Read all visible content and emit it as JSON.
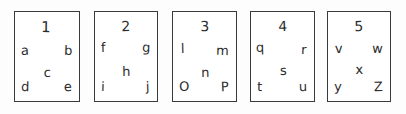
{
  "scene": {
    "description": "hand-drawn sketch of five numbered rectangular cards containing letters",
    "background_color": "#fdfdfd",
    "ink_color": "#2b2b2b",
    "border_color": "#3a3a3a"
  },
  "cards": [
    {
      "number": "1",
      "left": "a",
      "right": "b",
      "center": "c",
      "bottom_left": "d",
      "bottom_right": "e"
    },
    {
      "number": "2",
      "left": "f",
      "right": "g",
      "center": "h",
      "bottom_left": "i",
      "bottom_right": "j"
    },
    {
      "number": "3",
      "left": "l",
      "right": "m",
      "center": "n",
      "bottom_left": "O",
      "bottom_right": "P"
    },
    {
      "number": "4",
      "left": "q",
      "right": "r",
      "center": "s",
      "bottom_left": "t",
      "bottom_right": "u"
    },
    {
      "number": "5",
      "left": "v",
      "right": "w",
      "center": "x",
      "bottom_left": "y",
      "bottom_right": "Z"
    }
  ]
}
